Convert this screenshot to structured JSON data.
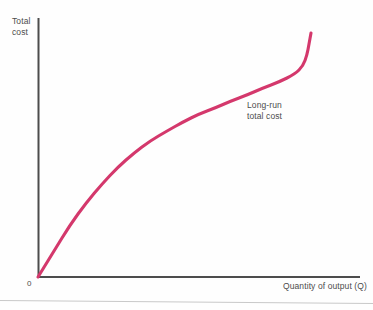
{
  "figure": {
    "origin_label": "0",
    "y_axis_title": "Total\ncost",
    "x_axis_title": "Quantity of output (Q)",
    "curve_annotation": "Long-run\ntotal cost",
    "colors": {
      "curve": "#d4386c",
      "axis": "#4d4d4d",
      "text": "#4c4c4c",
      "background": "#fefefe",
      "footer_rule": "#c9c9c9"
    }
  },
  "chart_data": {
    "type": "line",
    "title": "",
    "subtitle": "",
    "xlabel": "Quantity of output (Q)",
    "ylabel": "Total cost",
    "grid": false,
    "legend_position": "inline-annotation",
    "annotations": [
      {
        "text": "Long-run total cost",
        "points_to": "curve",
        "x_px": 247,
        "y_px": 100
      },
      {
        "text": "0",
        "points_to": "origin",
        "x_px": 27,
        "y_px": 278
      }
    ],
    "axis_ranges": {
      "x_px": [
        38,
        360
      ],
      "y_px": [
        18,
        277
      ]
    },
    "axes_ticks": {
      "x": [],
      "y": []
    },
    "series": [
      {
        "name": "Long-run total cost",
        "color": "#d4386c",
        "shape": "S-curve: concave from origin, inflection mid-range, convex at high output",
        "x": [
          0.0,
          0.05,
          0.1,
          0.15,
          0.2,
          0.25,
          0.3,
          0.35,
          0.4,
          0.45,
          0.5,
          0.55,
          0.6,
          0.65,
          0.7,
          0.75,
          0.8,
          0.85,
          0.9,
          0.95,
          1.0
        ],
        "y": [
          0.0,
          0.1,
          0.2,
          0.285,
          0.36,
          0.425,
          0.48,
          0.525,
          0.565,
          0.6,
          0.63,
          0.655,
          0.68,
          0.705,
          0.73,
          0.755,
          0.785,
          0.82,
          0.86,
          0.91,
          0.97
        ],
        "points_px": [
          [
            38,
            277
          ],
          [
            54,
            251
          ],
          [
            70,
            225
          ],
          [
            86,
            203
          ],
          [
            102,
            184
          ],
          [
            118,
            167
          ],
          [
            134,
            153
          ],
          [
            150,
            141
          ],
          [
            167,
            131
          ],
          [
            183,
            122
          ],
          [
            199,
            114
          ],
          [
            215,
            108
          ],
          [
            231,
            101
          ],
          [
            247,
            95
          ],
          [
            263,
            88
          ],
          [
            279,
            82
          ],
          [
            295,
            74
          ],
          [
            303,
            66
          ],
          [
            307,
            55
          ],
          [
            309,
            44
          ],
          [
            311,
            33
          ]
        ]
      }
    ],
    "xlim": [
      0,
      1
    ],
    "ylim": [
      0,
      1
    ]
  }
}
